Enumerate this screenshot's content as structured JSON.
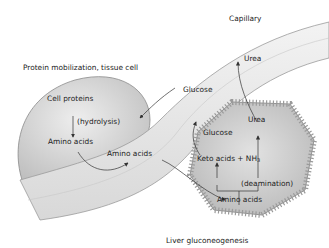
{
  "diagram": {
    "type": "metabolic-pathway-illustration",
    "labels": {
      "capillary": "Capillary",
      "tissue_cell_title": "Protein mobilization, tissue cell",
      "cell_proteins": "Cell proteins",
      "hydrolysis": "(hydrolysis)",
      "tissue_amino_acids": "Amino acids",
      "blood_amino_acids": "Amino acids",
      "blood_glucose": "Glucose",
      "blood_urea": "Urea",
      "liver_glucose": "Glucose",
      "liver_urea": "Urea",
      "keto_acids_nh3": "Keto acids + NH",
      "nh3_subscript": "3",
      "deamination": "(deamination)",
      "liver_amino_acids": "Amino acids",
      "liver_title": "Liver gluconeogenesis"
    },
    "colors": {
      "background": "#ffffff",
      "cell_fill": "#d6d6d6",
      "vessel_fill": "#e6e6e6",
      "outline": "#8a8a8a",
      "arrow": "#333333",
      "text": "#222222"
    }
  }
}
